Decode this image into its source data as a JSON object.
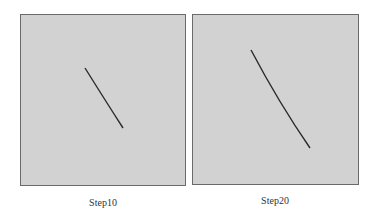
{
  "panels": [
    {
      "caption": "Step10",
      "background": "#d2d2d2",
      "stroke_color": "#2a2a2a",
      "line": {
        "x1": 64,
        "y1": 53,
        "x2": 102,
        "y2": 113
      }
    },
    {
      "caption": "Step20",
      "background": "#d2d2d2",
      "stroke_color": "#2a2a2a",
      "line": {
        "x1": 58,
        "y1": 35,
        "x2": 117,
        "y2": 133
      }
    }
  ]
}
